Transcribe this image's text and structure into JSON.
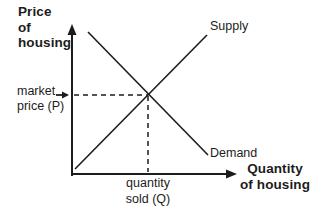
{
  "diagram": {
    "title_semantic": "Supply and demand diagram for the housing market",
    "y_axis_title": "Price\nof\nhousing",
    "x_axis_title": "Quantity\nof housing",
    "supply_label": "Supply",
    "demand_label": "Demand",
    "market_price_label": "market\nprice (P)",
    "quantity_sold_label": "quantity\nsold (Q)",
    "colors": {
      "ink": "#1c1c1c",
      "background": "#ffffff"
    }
  }
}
